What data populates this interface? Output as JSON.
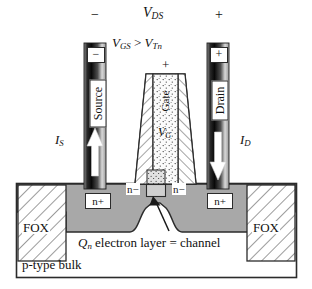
{
  "figure": {
    "top_labels": {
      "source_sign": "−",
      "vds": {
        "base": "V",
        "sub": "DS"
      },
      "drain_sign": "+"
    },
    "gate_bias": {
      "vgs": {
        "base": "V",
        "sub": "GS"
      },
      "relation": ">",
      "vtn": {
        "base": "V",
        "sub": "Tn"
      },
      "full": "V_GS > V_Tn"
    },
    "terminals": {
      "source": {
        "label": "Source",
        "polarity": "−",
        "current": {
          "base": "I",
          "sub": "S"
        },
        "arrow_direction": "up"
      },
      "drain": {
        "label": "Drain",
        "polarity": "+",
        "current": {
          "base": "I",
          "sub": "D"
        },
        "arrow_direction": "down"
      },
      "gate": {
        "label": "Gate",
        "polarity": "+",
        "voltage": {
          "base": "V",
          "sub": "G"
        },
        "fill": "dotted-polysilicon",
        "sidewall_fill": "hatched-oxide-spacer"
      }
    },
    "regions": {
      "field_oxide_left": "FOX",
      "field_oxide_right": "FOX",
      "nplus_left": "n+",
      "nplus_right": "n+",
      "nminus_left": "n−",
      "nminus_right": "n−",
      "substrate": "p-type bulk"
    },
    "annotation": {
      "charge": {
        "base": "Q",
        "sub": "n"
      },
      "text": "electron layer = channel",
      "full": "Q_n electron layer = channel",
      "pointer": "arrow-to-channel"
    },
    "colors": {
      "outline": "#2b2b2b",
      "diffusion_gray": "#a8a8a8",
      "channel_gray": "#c9c9c9",
      "hatch_line": "#555555",
      "bar_dark": "#111111",
      "bar_light": "#f2f2f2",
      "paper": "#ffffff"
    }
  }
}
